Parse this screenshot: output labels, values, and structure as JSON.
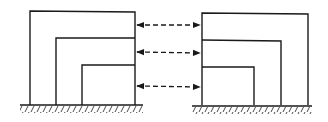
{
  "diagram": {
    "colors": {
      "line": "#1a1a1a",
      "background": "#ffffff"
    },
    "structures": [
      {
        "name": "left-structure",
        "levels": 3
      },
      {
        "name": "right-structure",
        "levels": 3
      }
    ],
    "connectors": [
      {
        "name": "top-connector",
        "type": "double-headed dashed arrow"
      },
      {
        "name": "middle-connector",
        "type": "double-headed dashed arrow"
      },
      {
        "name": "bottom-connector",
        "type": "double-headed dashed arrow"
      }
    ]
  }
}
